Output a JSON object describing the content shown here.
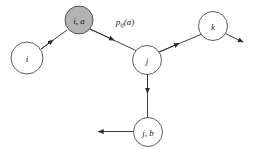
{
  "diagram": {
    "type": "directed-graph",
    "background_color": "#ffffff",
    "stroke_color": "#2b2b2b",
    "node_stroke_color": "#4a4a4a",
    "shaded_fill": "#b3b3b3",
    "plain_fill": "#ffffff",
    "nodes": [
      {
        "id": "i",
        "label": "i",
        "shaded": false,
        "cx": 27,
        "cy": 58,
        "r": 16
      },
      {
        "id": "i-a",
        "label": "i, a",
        "shaded": true,
        "cx": 79,
        "cy": 20,
        "r": 14
      },
      {
        "id": "j",
        "label": "j",
        "shaded": false,
        "cx": 147,
        "cy": 60,
        "r": 14.5
      },
      {
        "id": "k",
        "label": "k",
        "shaded": false,
        "cx": 213,
        "cy": 26,
        "r": 14.5
      },
      {
        "id": "j-b",
        "label": "j, b",
        "shaded": false,
        "cx": 148,
        "cy": 132,
        "r": 14.5
      }
    ],
    "edges": [
      {
        "id": "edge-i-to-ia",
        "from": "i",
        "to": "i-a",
        "arrow_midpoint": true,
        "label": ""
      },
      {
        "id": "edge-ia-to-j",
        "from": "i-a",
        "to": "j",
        "arrow_midpoint": true,
        "label": "p_ij(a)"
      },
      {
        "id": "edge-j-to-k",
        "from": "j",
        "to": "k",
        "arrow_midpoint": true,
        "label": ""
      },
      {
        "id": "edge-k-outgoing",
        "from": "k",
        "to": "outside-right",
        "arrow_midpoint": false,
        "label": ""
      },
      {
        "id": "edge-j-to-jb",
        "from": "j",
        "to": "j-b",
        "arrow_midpoint": true,
        "label": ""
      },
      {
        "id": "edge-jb-outgoing",
        "from": "j-b",
        "to": "outside-left",
        "arrow_midpoint": false,
        "label": ""
      }
    ],
    "labels": {
      "transition_prob_base": "p",
      "transition_prob_subscript": "ij",
      "transition_prob_arg": "(a)"
    }
  }
}
